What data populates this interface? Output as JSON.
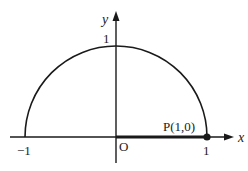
{
  "diagram": {
    "type": "unit-semicircle",
    "axes": {
      "x_label": "x",
      "y_label": "y",
      "origin_label": "O"
    },
    "ticks": {
      "x_neg": "−1",
      "x_pos": "1",
      "y_pos": "1"
    },
    "point": {
      "label": "P(1,0)",
      "x": 1,
      "y": 0
    },
    "highlighted_segment": {
      "from": "O",
      "to": "P"
    },
    "colors": {
      "stroke": "#1a1a1a",
      "background": "#ffffff"
    }
  }
}
